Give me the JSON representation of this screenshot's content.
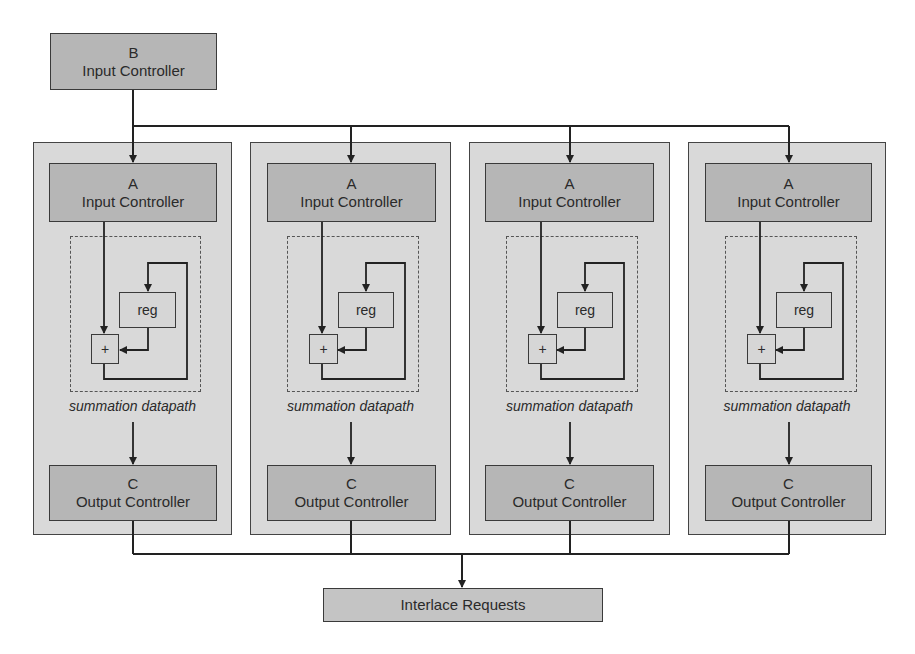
{
  "diagram": {
    "source": {
      "letter": "B",
      "label": "Input Controller"
    },
    "columns": [
      {
        "input": {
          "letter": "A",
          "label": "Input Controller"
        },
        "datapath": {
          "register": "reg",
          "adder": "+",
          "caption": "summation datapath"
        },
        "output": {
          "letter": "C",
          "label": "Output Controller"
        }
      },
      {
        "input": {
          "letter": "A",
          "label": "Input Controller"
        },
        "datapath": {
          "register": "reg",
          "adder": "+",
          "caption": "summation datapath"
        },
        "output": {
          "letter": "C",
          "label": "Output Controller"
        }
      },
      {
        "input": {
          "letter": "A",
          "label": "Input Controller"
        },
        "datapath": {
          "register": "reg",
          "adder": "+",
          "caption": "summation datapath"
        },
        "output": {
          "letter": "C",
          "label": "Output Controller"
        }
      },
      {
        "input": {
          "letter": "A",
          "label": "Input Controller"
        },
        "datapath": {
          "register": "reg",
          "adder": "+",
          "caption": "summation datapath"
        },
        "output": {
          "letter": "C",
          "label": "Output Controller"
        }
      }
    ],
    "sink": {
      "label": "Interlace Requests"
    },
    "colors": {
      "controller_fill": "#b6b6b6",
      "panel_fill": "#d9d9d9",
      "interlace_fill": "#c4c4c4",
      "line": "#222222"
    }
  }
}
